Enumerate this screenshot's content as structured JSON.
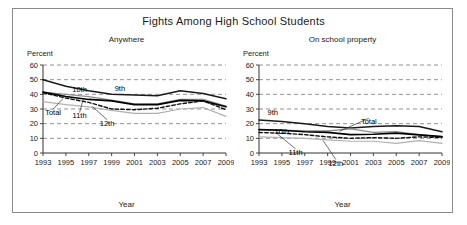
{
  "figure": {
    "title": "Fights Among High School Students",
    "x_axis_label": "Year",
    "y_axis_label": "Percent"
  },
  "chart_data": [
    {
      "type": "line",
      "title": "Anywhere",
      "xlabel": "Year",
      "ylabel": "Percent",
      "x": [
        1993,
        1995,
        1997,
        1999,
        2001,
        2003,
        2005,
        2007,
        2009
      ],
      "xlim": [
        1993,
        2009
      ],
      "ylim": [
        0,
        60
      ],
      "yticks": [
        0,
        10,
        20,
        30,
        40,
        50,
        60
      ],
      "grid": "horizontal-dashed",
      "legend": "inline-annotations",
      "series": [
        {
          "name": "9th",
          "style": "solid-dark",
          "values": [
            50.0,
            45.5,
            42.5,
            40.0,
            39.5,
            39.0,
            42.5,
            40.5,
            37.0
          ]
        },
        {
          "name": "10th",
          "style": "solid-gray",
          "values": [
            41.5,
            40.0,
            38.5,
            36.0,
            33.5,
            33.5,
            36.5,
            36.5,
            32.0
          ]
        },
        {
          "name": "Total",
          "style": "solid-black",
          "values": [
            41.5,
            38.5,
            36.5,
            35.5,
            33.0,
            33.0,
            35.9,
            35.5,
            31.5
          ]
        },
        {
          "name": "11th",
          "style": "dashed-black",
          "values": [
            41.0,
            37.5,
            34.5,
            30.0,
            29.5,
            30.5,
            33.5,
            35.5,
            29.5
          ]
        },
        {
          "name": "12th",
          "style": "solid-light",
          "values": [
            35.0,
            33.0,
            31.5,
            29.0,
            27.0,
            27.0,
            30.0,
            31.0,
            25.0
          ]
        }
      ]
    },
    {
      "type": "line",
      "title": "On school property",
      "xlabel": "Year",
      "ylabel": "Percent",
      "x": [
        1993,
        1995,
        1997,
        1999,
        2001,
        2003,
        2005,
        2007,
        2009
      ],
      "xlim": [
        1993,
        2009
      ],
      "ylim": [
        0,
        60
      ],
      "yticks": [
        0,
        10,
        20,
        30,
        40,
        50,
        60
      ],
      "grid": "horizontal-dashed",
      "legend": "inline-annotations",
      "series": [
        {
          "name": "9th",
          "style": "solid-dark",
          "values": [
            22.5,
            21.5,
            20.0,
            18.0,
            17.0,
            18.0,
            18.5,
            18.0,
            14.5
          ]
        },
        {
          "name": "10th",
          "style": "solid-gray",
          "values": [
            16.0,
            15.5,
            15.0,
            15.0,
            16.5,
            14.0,
            14.5,
            12.5,
            11.0
          ]
        },
        {
          "name": "Total",
          "style": "solid-black",
          "values": [
            16.0,
            15.5,
            14.5,
            14.0,
            12.5,
            12.8,
            13.6,
            12.4,
            11.1
          ]
        },
        {
          "name": "11th",
          "style": "dashed-black",
          "values": [
            14.0,
            13.5,
            12.5,
            11.0,
            10.0,
            10.5,
            10.0,
            11.0,
            10.5
          ]
        },
        {
          "name": "12th",
          "style": "solid-light",
          "values": [
            11.0,
            10.5,
            10.0,
            9.0,
            8.0,
            8.0,
            6.5,
            8.5,
            6.5
          ]
        }
      ]
    }
  ],
  "annotations": {
    "left": [
      "9th",
      "10th",
      "Total",
      "11th",
      "12th"
    ],
    "right": [
      "9th",
      "10th",
      "Total",
      "11th",
      "12th"
    ]
  },
  "colors": {
    "solid_dark": "#1a1a1a",
    "solid_gray": "#8d8d8d",
    "solid_black": "#000000",
    "dashed_black": "#111111",
    "solid_light": "#b0b0b0",
    "grid": "#777777",
    "axis": "#333333",
    "frame": "#8a8a8a",
    "background": "#ffffff"
  }
}
